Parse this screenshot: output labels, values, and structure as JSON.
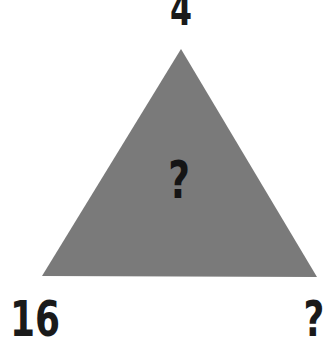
{
  "puzzle": {
    "top_value": "4",
    "center_value": "?",
    "bottom_left_value": "16",
    "bottom_right_value": "?"
  },
  "colors": {
    "background": "#ffffff",
    "triangle_fill": "#7a7a7a",
    "text": "#1a1a1a"
  }
}
